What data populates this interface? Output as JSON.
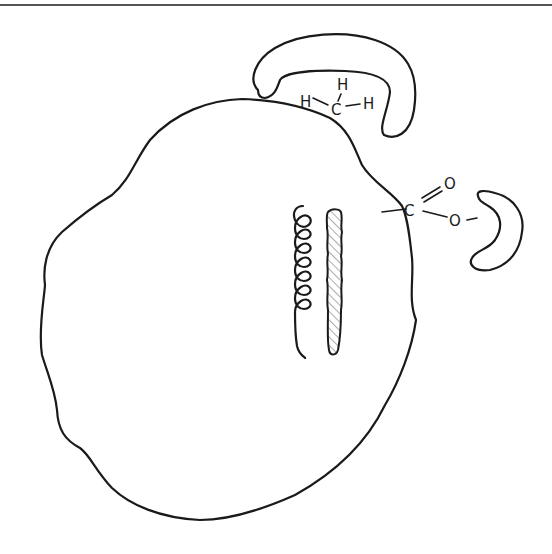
{
  "diagram": {
    "type": "line-art schematic",
    "elements": {
      "protein_outline": "large irregular globular shape",
      "hydrophobic_pocket": {
        "shape": "crescent pocket at top",
        "molecule": {
          "atoms": [
            "H",
            "H",
            "C",
            "H"
          ],
          "label_h_left": "H",
          "label_h_top": "H",
          "label_c": "C",
          "label_h_right": "H"
        }
      },
      "carboxyl_group": {
        "label_c": "C",
        "label_o_double": "O",
        "label_o_single": "O"
      },
      "small_crescent": "kidney-shaped crescent at right",
      "helix": "coiled spring (alpha helix)",
      "strand": "hatched rod (beta strand)"
    },
    "colors": {
      "line": "#1a1a1a",
      "background": "#ffffff",
      "top_rule": "#555555"
    }
  }
}
